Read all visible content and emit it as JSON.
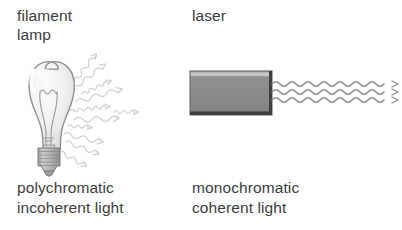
{
  "background_color": "#ffffff",
  "text_color": "#3d3d3d",
  "panels": [
    {
      "id": "filament-lamp",
      "heading": "filament\nlamp",
      "caption": "polychromatic\nincoherent light",
      "icon": "light-bulb-icon",
      "emission": {
        "style": "wavy-arrows-fan",
        "count": 11,
        "color": "#d2d2d2",
        "description": "irregular wavy arrows radiating in all directions"
      }
    },
    {
      "id": "laser",
      "heading": "laser",
      "caption": "monochromatic\ncoherent light",
      "icon": "laser-box-icon",
      "emission": {
        "style": "parallel-sine-waves",
        "count": 3,
        "color": "#8c8c8c",
        "description": "three parallel in-phase sine waves with arrowheads"
      }
    }
  ],
  "colors": {
    "bulb_glass": "#f2f2f2",
    "bulb_outline": "#8f8f8f",
    "bulb_base": "#b4b4b4",
    "laser_body": "#8a8a8a",
    "laser_body_dark": "#4f4f4f",
    "laser_body_light": "#c9c9c9",
    "ray_light": "#d2d2d2",
    "beam": "#8c8c8c"
  }
}
